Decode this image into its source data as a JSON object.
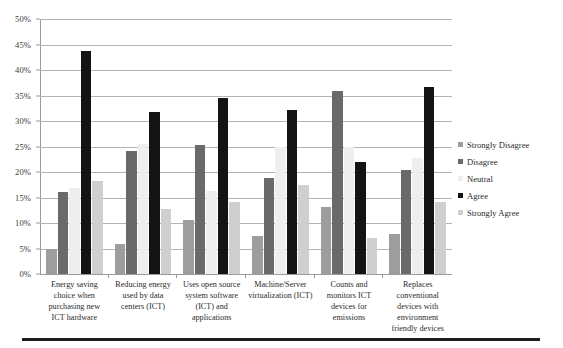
{
  "chart_data": {
    "type": "bar",
    "title": "",
    "subtitle": "",
    "xlabel": "",
    "ylabel": "",
    "ylim": [
      0,
      50
    ],
    "ytick_labels": [
      "50%",
      "45%",
      "40%",
      "35%",
      "30%",
      "25%",
      "20%",
      "15%",
      "10%",
      "5%",
      "0%"
    ],
    "ytick_values": [
      50,
      45,
      40,
      35,
      30,
      25,
      20,
      15,
      10,
      5,
      0
    ],
    "grid": true,
    "legend_position": "right",
    "value_suffix": "%",
    "categories": [
      "Energy saving choice when purchasing new ICT hardware",
      "Reducing energy used by data centers (ICT)",
      "Uses open source system software (ICT) and applications",
      "Machine/Server virtualization (ICT)",
      "Counts and monitors ICT devices for emissions",
      "Replaces conventional devices with environment friendly devices"
    ],
    "series": [
      {
        "name": "Strongly Disagree",
        "color": "#9d9d9d",
        "values": [
          5.0,
          5.8,
          10.6,
          7.4,
          13.2,
          7.8
        ]
      },
      {
        "name": "Disagree",
        "color": "#6a6a6a",
        "values": [
          16.0,
          24.2,
          25.2,
          18.8,
          35.8,
          20.4
        ]
      },
      {
        "name": "Neutral",
        "color": "#eeeeee",
        "values": [
          16.8,
          25.4,
          16.2,
          25.0,
          25.0,
          22.8
        ]
      },
      {
        "name": "Agree",
        "color": "#141414",
        "values": [
          43.8,
          31.8,
          34.6,
          32.2,
          22.0,
          36.6
        ]
      },
      {
        "name": "Strongly Agree",
        "color": "#cfcfcf",
        "values": [
          18.2,
          12.8,
          14.2,
          17.4,
          7.0,
          14.2
        ]
      }
    ]
  },
  "legend": {
    "items": [
      {
        "label": "Strongly Disagree"
      },
      {
        "label": "Disagree"
      },
      {
        "label": "Neutral"
      },
      {
        "label": "Agree"
      },
      {
        "label": "Strongly Agree"
      }
    ]
  }
}
